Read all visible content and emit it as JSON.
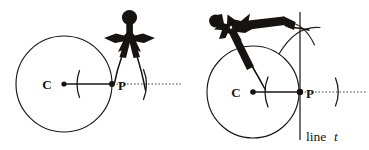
{
  "figure": {
    "canvas": {
      "width": 369,
      "height": 150,
      "background": "#ffffff"
    },
    "ink_color": "#17130f",
    "panels": [
      {
        "id": "panel-left",
        "step": "1",
        "caption": "",
        "circle": {
          "cx": 64,
          "cy": 84,
          "r": 48
        },
        "points": [
          {
            "name": "C",
            "label": "C",
            "x": 64,
            "y": 84,
            "label_dx": -12,
            "label_dy": 4
          },
          {
            "name": "P",
            "label": "P",
            "x": 112,
            "y": 84,
            "label_dx": 6,
            "label_dy": 5
          }
        ],
        "radius_segment": {
          "x1": 64,
          "y1": 84,
          "x2": 112,
          "y2": 84
        },
        "dotted_ray": {
          "x1": 112,
          "y1": 84,
          "x2": 180,
          "y2": 84
        },
        "arc_marks": [
          {
            "name": "arc-mark-left",
            "cx": 112,
            "cy": 84,
            "r": 36,
            "opens": "left"
          },
          {
            "name": "arc-mark-right",
            "cx": 112,
            "cy": 84,
            "r": 35,
            "opens": "right"
          }
        ],
        "compass": {
          "name": "compass-upright",
          "orientation": "upright",
          "needle_at": "P",
          "pencil_at": "arc-mark-right"
        }
      },
      {
        "id": "panel-right",
        "step": "2",
        "caption": "line t",
        "circle": {
          "cx": 253,
          "cy": 92,
          "r": 46
        },
        "points": [
          {
            "name": "C",
            "label": "C",
            "x": 253,
            "y": 92,
            "label_dx": -13,
            "label_dy": 4
          },
          {
            "name": "P",
            "label": "P",
            "x": 300,
            "y": 92,
            "label_dx": 6,
            "label_dy": 5
          }
        ],
        "radius_segment": {
          "x1": 253,
          "y1": 92,
          "x2": 300,
          "y2": 92
        },
        "dotted_ray": {
          "x1": 300,
          "y1": 92,
          "x2": 366,
          "y2": 92
        },
        "tangent_line": {
          "x1": 300,
          "y1": 12,
          "x2": 300,
          "y2": 140,
          "label": "line t"
        },
        "arc_marks": [
          {
            "name": "arc-mark-left",
            "cx": 300,
            "cy": 92,
            "r": 36,
            "opens": "left"
          },
          {
            "name": "arc-mark-right",
            "cx": 300,
            "cy": 92,
            "r": 38,
            "opens": "right"
          }
        ],
        "intersecting_arcs": [
          {
            "name": "arc-from-left-mark",
            "center_x": 265,
            "center_y": 92
          },
          {
            "name": "arc-from-right-mark",
            "center_x": 338,
            "center_y": 92
          }
        ],
        "compass": {
          "name": "compass-rotated",
          "orientation": "rotated-up-right",
          "needle_at": "arc-mark-left",
          "pencil_at": "arc-intersection"
        }
      }
    ],
    "labels": {
      "line_t_prefix": "line",
      "line_t_variable": "t"
    }
  }
}
